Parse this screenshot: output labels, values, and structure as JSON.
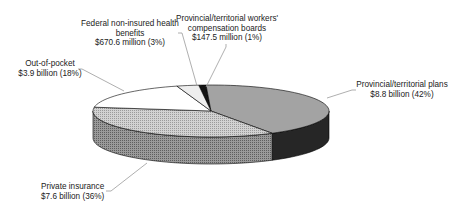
{
  "chart_data": {
    "type": "pie",
    "style": "3d-exploded-none",
    "title": "",
    "categories": [
      "Provincial/territorial workers' compensation boards",
      "Provincial/territorial plans",
      "Private insurance",
      "Out-of-pocket",
      "Federal non-insured health benefits"
    ],
    "values": [
      1,
      42,
      36,
      18,
      3
    ],
    "amounts": [
      "$147.5 million",
      "$8.8 billion",
      "$7.6 billion",
      "$3.9 billion",
      "$670.6 million"
    ],
    "units": "percent of total",
    "legend": "none (data labels with leader lines)",
    "colors": [
      "#111111",
      "#a6a6a6",
      "#c8c8c8",
      "#ffffff",
      "#ececec"
    ],
    "side_colors": [
      "#0a0a0a",
      "#2a2a2a",
      "#8c8c8c",
      "#ffffff",
      "#e0e0e0"
    ]
  },
  "labels": {
    "workers": {
      "line1": "Provincial/territorial workers'",
      "line2": "compensation boards",
      "line3": "$147.5 million (1%)"
    },
    "provincial": {
      "line1": "Provincial/territorial plans",
      "line2": "$8.8 billion (42%)"
    },
    "private": {
      "line1": "Private insurance",
      "line2": "$7.6 billion (36%)"
    },
    "oop": {
      "line1": "Out-of-pocket",
      "line2": "$3.9 billion (18%)"
    },
    "federal": {
      "line1": "Federal non-insured health",
      "line2": "benefits",
      "line3": "$670.6 million (3%)"
    }
  }
}
